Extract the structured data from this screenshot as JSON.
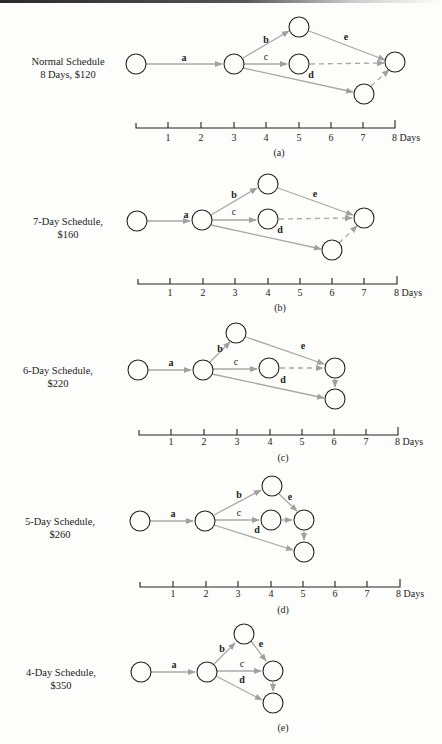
{
  "figure": {
    "panels": [
      {
        "id": "a",
        "caption": "(a)",
        "title_line1": "Normal Schedule",
        "title_line2": "8 Days, $120",
        "duration_days": 8,
        "cost": "$120",
        "edges": [
          {
            "label": "a",
            "from": "start",
            "to": "n2",
            "type": "activity"
          },
          {
            "label": "b",
            "from": "n2",
            "to": "top",
            "type": "activity"
          },
          {
            "label": "c",
            "from": "n2",
            "to": "mid",
            "type": "activity"
          },
          {
            "label": "d",
            "from": "n2",
            "to": "bottom",
            "type": "activity"
          },
          {
            "label": "e",
            "from": "top",
            "to": "end",
            "type": "activity"
          },
          {
            "label": "",
            "from": "mid",
            "to": "end",
            "type": "dummy"
          },
          {
            "label": "",
            "from": "bottom",
            "to": "end",
            "type": "dummy"
          }
        ]
      },
      {
        "id": "b",
        "caption": "(b)",
        "title_line1": "7-Day Schedule,",
        "title_line2": "$160",
        "duration_days": 7,
        "cost": "$160"
      },
      {
        "id": "c",
        "caption": "(c)",
        "title_line1": "6-Day Schedule,",
        "title_line2": "$220",
        "duration_days": 6,
        "cost": "$220"
      },
      {
        "id": "d",
        "caption": "(d)",
        "title_line1": "5-Day Schedule,",
        "title_line2": "$260",
        "duration_days": 5,
        "cost": "$260"
      },
      {
        "id": "e",
        "caption": "(e)",
        "title_line1": "4-Day Schedule,",
        "title_line2": "$350",
        "duration_days": 4,
        "cost": "$350"
      }
    ],
    "edge_labels": {
      "a": "a",
      "b": "b",
      "c": "c",
      "d": "d",
      "e": "e"
    },
    "axis": {
      "ticks": [
        "1",
        "2",
        "3",
        "4",
        "5",
        "6",
        "7",
        "8 Days"
      ]
    }
  }
}
